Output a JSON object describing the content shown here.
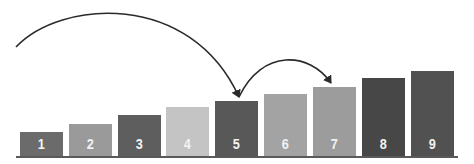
{
  "diagram": {
    "bars": [
      {
        "label": "1",
        "x": 20,
        "top": 132,
        "color": "#6b6b6b"
      },
      {
        "label": "2",
        "x": 69,
        "top": 124,
        "color": "#9a9a9a"
      },
      {
        "label": "3",
        "x": 118,
        "top": 115,
        "color": "#5e5e5e"
      },
      {
        "label": "4",
        "x": 166,
        "top": 107,
        "color": "#c4c4c4"
      },
      {
        "label": "5",
        "x": 215,
        "top": 101,
        "color": "#585858"
      },
      {
        "label": "6",
        "x": 264,
        "top": 94,
        "color": "#a3a3a3"
      },
      {
        "label": "7",
        "x": 313,
        "top": 87,
        "color": "#9c9c9c"
      },
      {
        "label": "8",
        "x": 362,
        "top": 78,
        "color": "#474747"
      },
      {
        "label": "9",
        "x": 411,
        "top": 71,
        "color": "#515151"
      }
    ],
    "bar_width": 43,
    "baseline_y": 156,
    "arcs": [
      {
        "name": "arc-to-5",
        "from": "left-edge",
        "to": "5"
      },
      {
        "name": "arc-5-to-7",
        "from": "5",
        "to": "7"
      }
    ],
    "line_color": "#2a2a2a"
  }
}
